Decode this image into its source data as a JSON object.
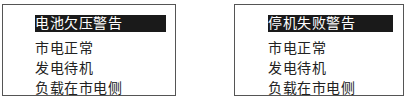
{
  "screens": [
    {
      "items": [
        {
          "label": "电池欠压警告",
          "selected": true
        },
        {
          "label": "市电正常"
        },
        {
          "label": "发电待机"
        },
        {
          "label": "负载在市电侧"
        }
      ]
    },
    {
      "items": [
        {
          "label": "停机失败警告",
          "selected": true
        },
        {
          "label": "市电正常"
        },
        {
          "label": "发电待机"
        },
        {
          "label": "负载在市电侧"
        }
      ]
    }
  ]
}
